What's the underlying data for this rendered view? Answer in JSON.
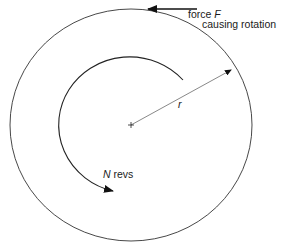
{
  "diagram": {
    "type": "rotation-work-diagram",
    "labels": {
      "force": "force",
      "force_symbol": "F",
      "force_desc": "causing rotation",
      "radius": "r",
      "revs_symbol": "N",
      "revs": "revs"
    },
    "geometry": {
      "center": [
        131,
        125
      ],
      "outer_radius_x": 121,
      "outer_radius_y": 116,
      "inner_radius": 71
    },
    "colors": {
      "stroke": "#333333",
      "text": "#1a1a1a",
      "background": "#ffffff"
    }
  }
}
